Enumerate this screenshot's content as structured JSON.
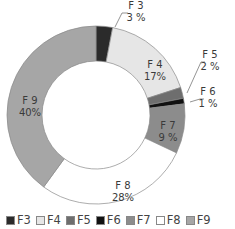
{
  "chart_data": {
    "type": "pie",
    "subtype": "donut",
    "title": "",
    "categories": [
      "F3",
      "F4",
      "F5",
      "F6",
      "F7",
      "F8",
      "F9"
    ],
    "values": [
      3,
      17,
      2,
      1,
      9,
      28,
      40
    ],
    "value_labels": [
      "3 %",
      "17%",
      "2 %",
      "1 %",
      "9 %",
      "28%",
      "40%"
    ],
    "colors": [
      "#2b2b2b",
      "#e6e6e6",
      "#6e6e6e",
      "#111111",
      "#8c8c8c",
      "#ffffff",
      "#a6a6a6"
    ],
    "start_angle": "12 o'clock",
    "direction": "clockwise",
    "legend_position": "bottom",
    "annotations": [
      {
        "name": "F3",
        "text": "3 %",
        "position": "outside-top",
        "leader_line": true
      },
      {
        "name": "F4",
        "text": "17%",
        "position": "inside"
      },
      {
        "name": "F5",
        "text": "2 %",
        "position": "outside-right",
        "leader_line": true
      },
      {
        "name": "F6",
        "text": "1 %",
        "position": "outside-right",
        "leader_line": true
      },
      {
        "name": "F7",
        "text": "9 %",
        "position": "inside"
      },
      {
        "name": "F8",
        "text": "28%",
        "position": "inside"
      },
      {
        "name": "F9",
        "text": "40%",
        "position": "inside"
      }
    ]
  },
  "legend": [
    {
      "label": "F3",
      "color": "#2b2b2b"
    },
    {
      "label": "F4",
      "color": "#e6e6e6"
    },
    {
      "label": "F5",
      "color": "#6e6e6e"
    },
    {
      "label": "F6",
      "color": "#111111"
    },
    {
      "label": "F7",
      "color": "#8c8c8c"
    },
    {
      "label": "F8",
      "color": "#ffffff"
    },
    {
      "label": "F9",
      "color": "#a6a6a6"
    }
  ]
}
